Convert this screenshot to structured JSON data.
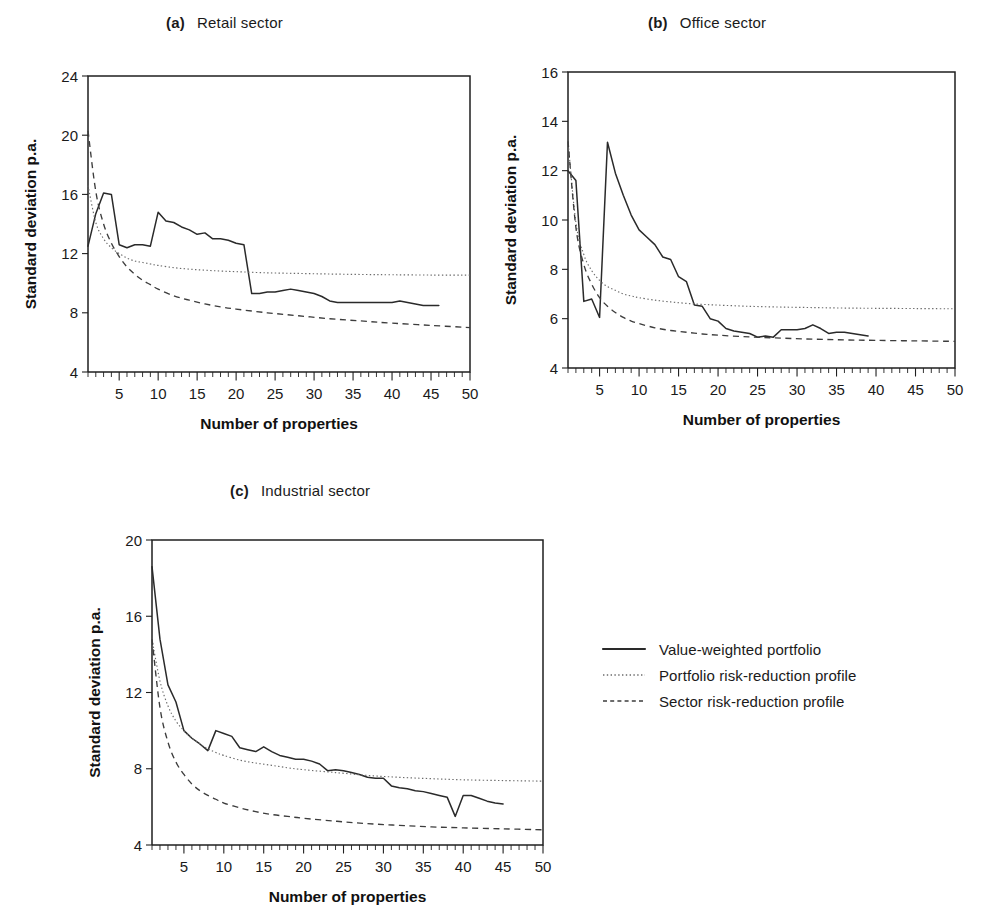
{
  "figure": {
    "background": "#ffffff",
    "ink_color": "#1f1f1f",
    "solid_color": "#2a2a2a",
    "dotted_color": "#6b6b6b",
    "dashed_color": "#3d3d3d"
  },
  "legend": {
    "items": [
      {
        "label": "Value-weighted portfolio",
        "style": "solid"
      },
      {
        "label": "Portfolio risk-reduction profile",
        "style": "dotted"
      },
      {
        "label": "Sector risk-reduction profile",
        "style": "dashed"
      }
    ]
  },
  "chart_data": [
    {
      "type": "line",
      "panel": "a",
      "tag": "(a)",
      "title": "Retail sector",
      "xlabel": "Number of properties",
      "ylabel": "Standard deviation p.a.",
      "xlim": [
        1,
        50
      ],
      "ylim": [
        4,
        24
      ],
      "xticks": [
        5,
        10,
        15,
        20,
        25,
        30,
        35,
        40,
        45,
        50
      ],
      "yticks": [
        4,
        8,
        12,
        16,
        20,
        24
      ],
      "minor_tick_step": 1,
      "grid": false,
      "legend_position": "external-right",
      "series": [
        {
          "name": "Value-weighted portfolio",
          "style": "solid",
          "x": [
            1,
            2,
            3,
            4,
            5,
            6,
            7,
            8,
            9,
            10,
            11,
            12,
            13,
            14,
            15,
            16,
            17,
            18,
            19,
            20,
            21,
            22,
            23,
            24,
            25,
            26,
            27,
            28,
            29,
            30,
            31,
            32,
            33,
            34,
            35,
            36,
            37,
            38,
            39,
            40,
            41,
            42,
            43,
            44,
            45,
            46
          ],
          "values": [
            12.5,
            14.7,
            16.1,
            16.0,
            12.6,
            12.4,
            12.6,
            12.6,
            12.5,
            14.8,
            14.2,
            14.1,
            13.8,
            13.6,
            13.3,
            13.4,
            13.0,
            13.0,
            12.9,
            12.7,
            12.6,
            9.3,
            9.3,
            9.4,
            9.4,
            9.5,
            9.6,
            9.5,
            9.4,
            9.3,
            9.1,
            8.8,
            8.7,
            8.7,
            8.7,
            8.7,
            8.7,
            8.7,
            8.7,
            8.7,
            8.8,
            8.7,
            8.6,
            8.5,
            8.5,
            8.5
          ]
        },
        {
          "name": "Portfolio risk-reduction profile",
          "style": "dotted",
          "x": [
            1,
            2,
            3,
            4,
            5,
            6,
            7,
            8,
            9,
            10,
            12,
            14,
            16,
            18,
            20,
            24,
            28,
            32,
            36,
            40,
            45,
            50
          ],
          "values": [
            16.6,
            14.1,
            13.0,
            12.4,
            12.0,
            11.7,
            11.5,
            11.4,
            11.3,
            11.2,
            11.05,
            10.95,
            10.88,
            10.82,
            10.78,
            10.7,
            10.66,
            10.62,
            10.59,
            10.57,
            10.55,
            10.55
          ]
        },
        {
          "name": "Sector risk-reduction profile",
          "style": "dashed",
          "x": [
            1,
            2,
            3,
            4,
            5,
            6,
            7,
            8,
            9,
            10,
            12,
            14,
            16,
            18,
            20,
            24,
            28,
            32,
            36,
            40,
            45,
            50
          ],
          "values": [
            20.3,
            16.2,
            14.0,
            12.7,
            11.8,
            11.1,
            10.6,
            10.2,
            9.9,
            9.6,
            9.15,
            8.85,
            8.6,
            8.4,
            8.25,
            8.0,
            7.8,
            7.6,
            7.45,
            7.3,
            7.15,
            7.0
          ]
        }
      ]
    },
    {
      "type": "line",
      "panel": "b",
      "tag": "(b)",
      "title": "Office sector",
      "xlabel": "Number of properties",
      "ylabel": "Standard deviation p.a.",
      "xlim": [
        1,
        50
      ],
      "ylim": [
        4,
        16
      ],
      "xticks": [
        5,
        10,
        15,
        20,
        25,
        30,
        35,
        40,
        45,
        50
      ],
      "yticks": [
        4,
        6,
        8,
        10,
        12,
        14,
        16
      ],
      "minor_tick_step": 1,
      "grid": false,
      "legend_position": "external-right",
      "series": [
        {
          "name": "Value-weighted portfolio",
          "style": "solid",
          "x": [
            1,
            2,
            3,
            4,
            5,
            6,
            7,
            8,
            9,
            10,
            11,
            12,
            13,
            14,
            15,
            16,
            17,
            18,
            19,
            20,
            21,
            22,
            23,
            24,
            25,
            26,
            27,
            28,
            29,
            30,
            31,
            32,
            33,
            34,
            35,
            36,
            37,
            38,
            39
          ],
          "values": [
            12.0,
            11.6,
            6.7,
            6.8,
            6.05,
            13.15,
            11.9,
            11.0,
            10.2,
            9.6,
            9.3,
            9.0,
            8.5,
            8.4,
            7.7,
            7.5,
            6.55,
            6.5,
            6.0,
            5.9,
            5.6,
            5.5,
            5.45,
            5.4,
            5.25,
            5.3,
            5.25,
            5.55,
            5.55,
            5.55,
            5.6,
            5.75,
            5.6,
            5.4,
            5.45,
            5.45,
            5.4,
            5.35,
            5.3
          ]
        },
        {
          "name": "Portfolio risk-reduction profile",
          "style": "dotted",
          "x": [
            1,
            2,
            3,
            4,
            5,
            6,
            7,
            8,
            9,
            10,
            12,
            14,
            16,
            18,
            20,
            24,
            28,
            32,
            36,
            40,
            45,
            50
          ],
          "values": [
            13.2,
            9.9,
            8.6,
            7.95,
            7.55,
            7.3,
            7.15,
            7.0,
            6.92,
            6.85,
            6.75,
            6.68,
            6.62,
            6.58,
            6.55,
            6.5,
            6.47,
            6.45,
            6.43,
            6.42,
            6.41,
            6.4
          ]
        },
        {
          "name": "Sector risk-reduction profile",
          "style": "dashed",
          "x": [
            1,
            2,
            3,
            4,
            5,
            6,
            7,
            8,
            9,
            10,
            12,
            14,
            16,
            18,
            20,
            24,
            28,
            32,
            36,
            40,
            45,
            50
          ],
          "values": [
            13.2,
            9.7,
            8.2,
            7.4,
            6.85,
            6.5,
            6.25,
            6.05,
            5.9,
            5.8,
            5.63,
            5.52,
            5.45,
            5.38,
            5.33,
            5.26,
            5.21,
            5.17,
            5.14,
            5.12,
            5.1,
            5.08
          ]
        }
      ]
    },
    {
      "type": "line",
      "panel": "c",
      "tag": "(c)",
      "title": "Industrial sector",
      "xlabel": "Number of properties",
      "ylabel": "Standard deviation p.a.",
      "xlim": [
        1,
        50
      ],
      "ylim": [
        4,
        20
      ],
      "xticks": [
        5,
        10,
        15,
        20,
        25,
        30,
        35,
        40,
        45,
        50
      ],
      "yticks": [
        4,
        8,
        12,
        16,
        20
      ],
      "minor_tick_step": 1,
      "grid": false,
      "legend_position": "external-right",
      "series": [
        {
          "name": "Value-weighted portfolio",
          "style": "solid",
          "x": [
            1,
            2,
            3,
            4,
            5,
            6,
            7,
            8,
            9,
            10,
            11,
            12,
            13,
            14,
            15,
            16,
            17,
            18,
            19,
            20,
            21,
            22,
            23,
            24,
            25,
            26,
            27,
            28,
            29,
            30,
            31,
            32,
            33,
            34,
            35,
            36,
            37,
            38,
            39,
            40,
            41,
            42,
            43,
            44,
            45
          ],
          "values": [
            18.6,
            14.8,
            12.4,
            11.5,
            10.0,
            9.6,
            9.3,
            8.95,
            10.0,
            9.85,
            9.7,
            9.1,
            9.0,
            8.9,
            9.15,
            8.9,
            8.7,
            8.6,
            8.5,
            8.5,
            8.4,
            8.25,
            7.9,
            7.95,
            7.9,
            7.8,
            7.7,
            7.55,
            7.5,
            7.5,
            7.1,
            7.0,
            6.95,
            6.85,
            6.8,
            6.7,
            6.6,
            6.5,
            5.5,
            6.6,
            6.6,
            6.45,
            6.3,
            6.2,
            6.15
          ]
        },
        {
          "name": "Portfolio risk-reduction profile",
          "style": "dotted",
          "x": [
            1,
            2,
            3,
            4,
            5,
            6,
            7,
            8,
            9,
            10,
            12,
            14,
            16,
            18,
            20,
            24,
            28,
            32,
            36,
            40,
            45,
            50
          ],
          "values": [
            14.8,
            12.6,
            11.3,
            10.5,
            10.0,
            9.6,
            9.3,
            9.05,
            8.85,
            8.7,
            8.45,
            8.3,
            8.18,
            8.05,
            7.95,
            7.8,
            7.65,
            7.55,
            7.48,
            7.42,
            7.38,
            7.35
          ]
        },
        {
          "name": "Sector risk-reduction profile",
          "style": "dashed",
          "x": [
            1,
            2,
            3,
            4,
            5,
            6,
            7,
            8,
            9,
            10,
            12,
            14,
            16,
            18,
            20,
            24,
            28,
            32,
            36,
            40,
            45,
            50
          ],
          "values": [
            14.8,
            11.2,
            9.4,
            8.35,
            7.7,
            7.2,
            6.85,
            6.6,
            6.4,
            6.2,
            5.95,
            5.75,
            5.6,
            5.5,
            5.4,
            5.25,
            5.12,
            5.03,
            4.95,
            4.9,
            4.85,
            4.8
          ]
        }
      ]
    }
  ]
}
